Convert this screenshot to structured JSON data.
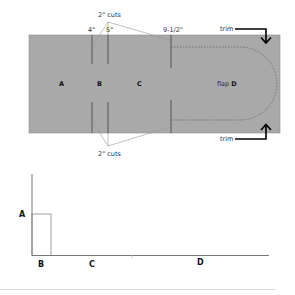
{
  "top_diagram": {
    "fill_color": "#a9a9a9",
    "cut_labels": {
      "top": "2\" cuts",
      "bottom": "2\" cuts"
    },
    "measurements": [
      "4\"",
      "5\"",
      "9-1/2\""
    ],
    "segments": {
      "a": "A",
      "b": "B",
      "c": "C",
      "d_prefix": "flap ",
      "d": "D"
    },
    "trim_labels": {
      "top": "trim",
      "bottom": "trim"
    }
  },
  "bottom_chart": {
    "y_label": "A",
    "x_labels": [
      "B",
      "C",
      "D"
    ]
  }
}
